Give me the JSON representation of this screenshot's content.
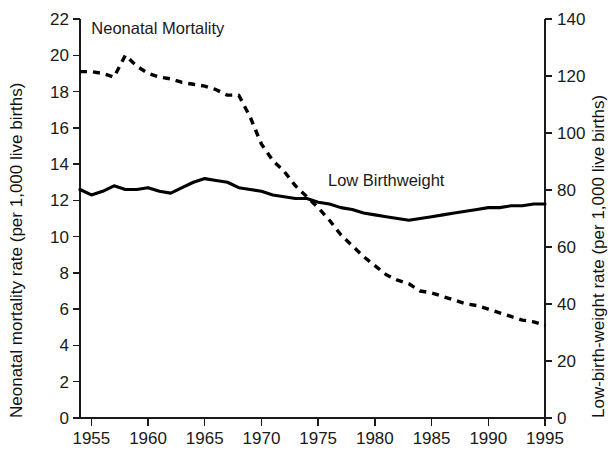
{
  "chart_data": {
    "type": "line",
    "title": "",
    "subtitle": "",
    "xlabel": "",
    "ylabel": "Neonatal mortality rate (per 1,000 live births)",
    "y2label": "Low-birth-weight rate (per 1,000 live births)",
    "xlim": [
      1954,
      1995
    ],
    "ylim": [
      0,
      22
    ],
    "y2lim": [
      0,
      140
    ],
    "grid": false,
    "legend_position": "inline-annotations",
    "background_color": "#ffffff",
    "line_color": "#000000",
    "x_ticks": [
      1955,
      1960,
      1965,
      1970,
      1975,
      1980,
      1985,
      1990,
      1995
    ],
    "x_tick_labels": [
      "1955",
      "1960",
      "1965",
      "1970",
      "1975",
      "1980",
      "1985",
      "1990",
      "1995"
    ],
    "y_ticks": [
      0,
      2,
      4,
      6,
      8,
      10,
      12,
      14,
      16,
      18,
      20,
      22
    ],
    "y_tick_labels": [
      "0",
      "2",
      "4",
      "6",
      "8",
      "10",
      "12",
      "14",
      "16",
      "18",
      "20",
      "22"
    ],
    "y2_ticks": [
      0,
      20,
      40,
      60,
      80,
      100,
      120,
      140
    ],
    "y2_tick_labels": [
      "0",
      "20",
      "40",
      "60",
      "80",
      "100",
      "120",
      "140"
    ],
    "x": [
      1954,
      1955,
      1956,
      1957,
      1958,
      1959,
      1960,
      1961,
      1962,
      1963,
      1964,
      1965,
      1966,
      1967,
      1968,
      1969,
      1970,
      1971,
      1972,
      1973,
      1974,
      1975,
      1976,
      1977,
      1978,
      1979,
      1980,
      1981,
      1982,
      1983,
      1984,
      1985,
      1986,
      1987,
      1988,
      1989,
      1990,
      1991,
      1992,
      1993,
      1994,
      1995
    ],
    "series": [
      {
        "name": "Neonatal Mortality",
        "axis": "left",
        "style": "dashed",
        "units": "per 1,000 live births",
        "values": [
          19.1,
          19.1,
          19.0,
          18.8,
          20.0,
          19.4,
          19.0,
          18.8,
          18.7,
          18.5,
          18.4,
          18.3,
          18.1,
          17.8,
          17.8,
          16.6,
          15.1,
          14.2,
          13.6,
          12.8,
          12.2,
          11.6,
          10.9,
          10.1,
          9.5,
          8.9,
          8.4,
          7.9,
          7.6,
          7.4,
          7.0,
          6.9,
          6.7,
          6.5,
          6.3,
          6.2,
          6.0,
          5.8,
          5.6,
          5.4,
          5.3,
          5.1
        ]
      },
      {
        "name": "Low Birthweight",
        "axis": "right",
        "style": "solid",
        "units": "per 1,000 live births",
        "values_left_scale": [
          12.6,
          12.3,
          12.5,
          12.8,
          12.6,
          12.6,
          12.7,
          12.5,
          12.4,
          12.7,
          13.0,
          13.2,
          13.1,
          13.0,
          12.7,
          12.6,
          12.5,
          12.3,
          12.2,
          12.1,
          12.1,
          11.9,
          11.8,
          11.6,
          11.5,
          11.3,
          11.2,
          11.1,
          11.0,
          10.9,
          11.0,
          11.1,
          11.2,
          11.3,
          11.4,
          11.5,
          11.6,
          11.6,
          11.7,
          11.7,
          11.8,
          11.8
        ],
        "values": [
          79,
          77,
          78,
          80,
          79,
          79,
          80,
          78,
          78,
          80,
          82,
          83,
          82,
          82,
          80,
          79,
          78,
          77,
          77,
          76,
          76,
          75,
          74,
          73,
          72,
          71,
          70,
          70,
          69,
          68,
          69,
          70,
          70,
          71,
          72,
          72,
          73,
          73,
          73,
          74,
          74,
          74
        ]
      }
    ],
    "annotations": [
      {
        "text": "Neonatal Mortality",
        "x": 1955,
        "y": 21.2
      },
      {
        "text": "Low Birthweight",
        "x": 1981,
        "y": 12.8
      }
    ]
  }
}
